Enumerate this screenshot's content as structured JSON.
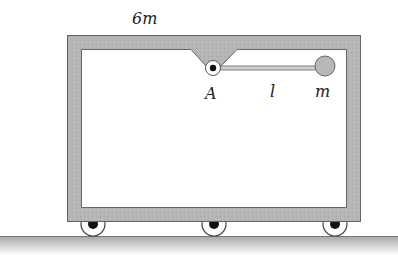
{
  "diagram": {
    "labels": {
      "cart_mass": "6m",
      "pivot": "A",
      "rod_length": "l",
      "bob_mass": "m"
    },
    "colors": {
      "frame_fill": "#b4b4b4",
      "frame_stroke": "#6a6a6a",
      "inner": "#ffffff",
      "ground_top": "#9c9c9c",
      "ground_bottom": "#ffffff",
      "ball_fill": "#b8b8b8",
      "wheel_hub": "#111111"
    },
    "wheels": [
      {
        "name": "wheel-left"
      },
      {
        "name": "wheel-middle"
      },
      {
        "name": "wheel-right"
      }
    ]
  }
}
